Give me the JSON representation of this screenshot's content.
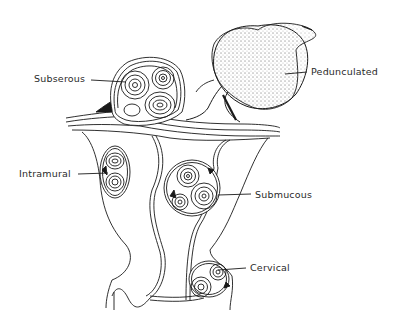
{
  "diagram": {
    "colors": {
      "line": "#1a1a1a",
      "stipple": "#555555",
      "background": "#ffffff",
      "label": "#2a2a2a"
    },
    "labels": [
      {
        "id": "subserous",
        "text": "Subserous",
        "x": 34,
        "y": 74
      },
      {
        "id": "pedunculated",
        "text": "Pedunculated",
        "x": 311,
        "y": 68
      },
      {
        "id": "intramural",
        "text": "Intramural",
        "x": 19,
        "y": 170
      },
      {
        "id": "submucous",
        "text": "Submucous",
        "x": 255,
        "y": 190
      },
      {
        "id": "cervical",
        "text": "Cervical",
        "x": 250,
        "y": 263
      }
    ]
  }
}
